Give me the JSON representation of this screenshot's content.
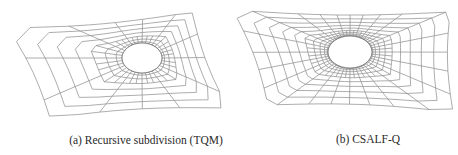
{
  "figure": {
    "panels": [
      {
        "id": "a",
        "caption": "(a) Recursive subdivision (TQM)",
        "method": "Recursive subdivision (TQM)",
        "mesh": {
          "outline": [
            [
              8,
              28
            ],
            [
              192,
              12
            ],
            [
              228,
              108
            ],
            [
              50,
              118
            ]
          ],
          "hole": {
            "cx": 142,
            "cy": 58,
            "rx": 20,
            "ry": 15
          },
          "radial_lines": 36,
          "rings": 7,
          "refinement_near_hole": "transition",
          "stroke": "#8a8a8a"
        }
      },
      {
        "id": "b",
        "caption": "(b) CSALF-Q",
        "method": "CSALF-Q",
        "mesh": {
          "outline": [
            [
              233,
              10
            ],
            [
              450,
              12
            ],
            [
              453,
              112
            ],
            [
              268,
              105
            ]
          ],
          "hole": {
            "cx": 350,
            "cy": 52,
            "rx": 22,
            "ry": 16
          },
          "radial_lines": 48,
          "rings": 10,
          "refinement_near_hole": "dense",
          "stroke": "#8a8a8a"
        }
      }
    ]
  }
}
